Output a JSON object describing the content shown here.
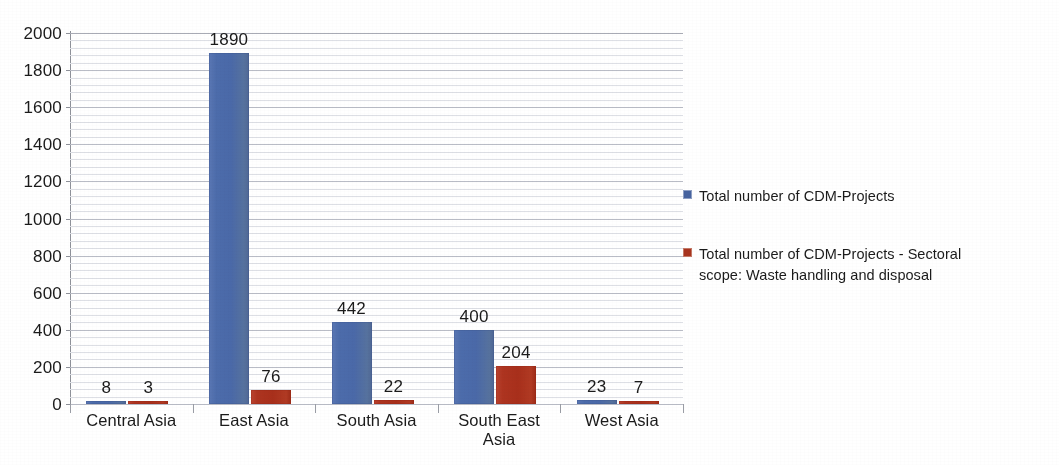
{
  "title_fragment": "",
  "chart_data": {
    "type": "bar",
    "title": "",
    "subtitle": "",
    "xlabel": "",
    "ylabel": "",
    "ylim": [
      0,
      2000
    ],
    "y_ticks": [
      "0",
      "200",
      "400",
      "600",
      "800",
      "1000",
      "1200",
      "1400",
      "1600",
      "1800",
      "2000"
    ],
    "y_tick_values": [
      0,
      200,
      400,
      600,
      800,
      1000,
      1200,
      1400,
      1600,
      1800,
      2000
    ],
    "y_major_step": 200,
    "y_minor_step": 40,
    "grid": true,
    "grid_orientation": "horizontal",
    "legend_position": "right",
    "categories": [
      "Central Asia",
      "East Asia",
      "South Asia",
      "South East Asia",
      "West Asia"
    ],
    "category_lines": [
      [
        "Central Asia"
      ],
      [
        "East Asia"
      ],
      [
        "South Asia"
      ],
      [
        "South East",
        "Asia"
      ],
      [
        "West Asia"
      ]
    ],
    "series": [
      {
        "name": "Total number of CDM-Projects",
        "color": "#4a69a8",
        "values": [
          8,
          1890,
          442,
          400,
          23
        ],
        "labels": [
          "8",
          "1890",
          "442",
          "400",
          "23"
        ]
      },
      {
        "name": "Total number of CDM-Projects - Sectoral scope: Waste handling and disposal",
        "color": "#a8341e",
        "values": [
          3,
          76,
          22,
          204,
          7
        ],
        "labels": [
          "3",
          "76",
          "22",
          "204",
          "7"
        ]
      }
    ]
  },
  "legend": {
    "items": [
      {
        "swatch": "blue",
        "lines": [
          "Total number of CDM-Projects"
        ]
      },
      {
        "swatch": "red",
        "lines": [
          "Total number of CDM-Projects - Sectoral",
          "scope: Waste handling and disposal"
        ]
      }
    ]
  }
}
